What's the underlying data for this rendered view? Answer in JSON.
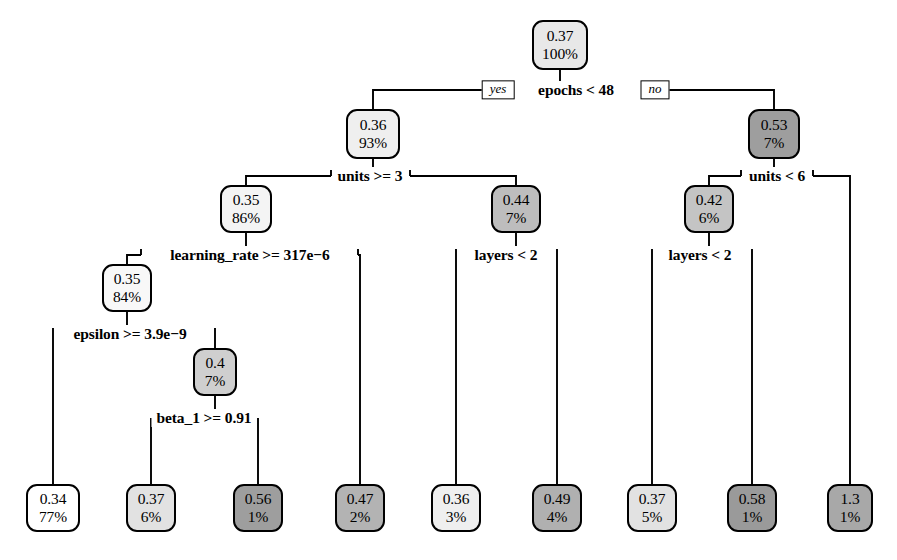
{
  "figure": {
    "kind": "decision-tree",
    "background": "#ffffff",
    "stroke": "#000000",
    "width": 897,
    "height": 560
  },
  "chart_data": {
    "type": "diagram",
    "subtype": "regression-decision-tree",
    "title": "",
    "xlabel": "",
    "ylabel": "",
    "branch_labels": {
      "yes": "yes",
      "no": "no"
    },
    "nodes": [
      {
        "id": "n0",
        "value": "0.37",
        "percent": "100%",
        "fill": "#e8e8e8",
        "x": 560,
        "y": 45,
        "w": 56,
        "h": 50
      },
      {
        "id": "n1",
        "value": "0.36",
        "percent": "93%",
        "fill": "#efefef",
        "x": 373,
        "y": 134,
        "w": 54,
        "h": 50
      },
      {
        "id": "n2",
        "value": "0.53",
        "percent": "7%",
        "fill": "#9e9e9e",
        "x": 774,
        "y": 134,
        "w": 52,
        "h": 50
      },
      {
        "id": "n3",
        "value": "0.35",
        "percent": "86%",
        "fill": "#f4f4f4",
        "x": 246,
        "y": 209,
        "w": 52,
        "h": 48
      },
      {
        "id": "n4",
        "value": "0.44",
        "percent": "7%",
        "fill": "#bdbdbd",
        "x": 516,
        "y": 209,
        "w": 50,
        "h": 48
      },
      {
        "id": "n5",
        "value": "0.42",
        "percent": "6%",
        "fill": "#c4c4c4",
        "x": 709,
        "y": 209,
        "w": 50,
        "h": 48
      },
      {
        "id": "n6",
        "value": "0.35",
        "percent": "84%",
        "fill": "#f8f8f8",
        "x": 127,
        "y": 288,
        "w": 50,
        "h": 48
      },
      {
        "id": "n7",
        "value": "0.4",
        "percent": "7%",
        "fill": "#cfcfcf",
        "x": 215,
        "y": 372,
        "w": 44,
        "h": 48
      },
      {
        "id": "n8",
        "value": "0.34",
        "percent": "77%",
        "fill": "#ffffff",
        "x": 53,
        "y": 508,
        "w": 54,
        "h": 48
      },
      {
        "id": "n9",
        "value": "0.37",
        "percent": "6%",
        "fill": "#e2e2e2",
        "x": 151,
        "y": 508,
        "w": 50,
        "h": 48
      },
      {
        "id": "n10",
        "value": "0.56",
        "percent": "1%",
        "fill": "#9e9e9e",
        "x": 258,
        "y": 508,
        "w": 50,
        "h": 48
      },
      {
        "id": "n11",
        "value": "0.47",
        "percent": "2%",
        "fill": "#b3b3b3",
        "x": 360,
        "y": 508,
        "w": 50,
        "h": 48
      },
      {
        "id": "n12",
        "value": "0.36",
        "percent": "3%",
        "fill": "#efefef",
        "x": 456,
        "y": 508,
        "w": 50,
        "h": 48
      },
      {
        "id": "n13",
        "value": "0.49",
        "percent": "4%",
        "fill": "#b0b0b0",
        "x": 557,
        "y": 508,
        "w": 50,
        "h": 48
      },
      {
        "id": "n14",
        "value": "0.37",
        "percent": "5%",
        "fill": "#e2e2e2",
        "x": 652,
        "y": 508,
        "w": 50,
        "h": 48
      },
      {
        "id": "n15",
        "value": "0.58",
        "percent": "1%",
        "fill": "#9a9a9a",
        "x": 752,
        "y": 508,
        "w": 50,
        "h": 48
      },
      {
        "id": "n16",
        "value": "1.3",
        "percent": "1%",
        "fill": "#a8a8a8",
        "x": 850,
        "y": 508,
        "w": 46,
        "h": 48
      }
    ],
    "splits": [
      {
        "id": "s0",
        "label": "epochs < 48",
        "x": 576,
        "y": 90,
        "parent": "n0",
        "yes_child": "n1",
        "no_child": "n2"
      },
      {
        "id": "s1",
        "label": "units >= 3",
        "x": 370,
        "y": 176,
        "parent": "n1",
        "yes_child": "n3",
        "no_child": "n4"
      },
      {
        "id": "s2",
        "label": "units < 6",
        "x": 777,
        "y": 176,
        "parent": "n2",
        "yes_child": "n5",
        "no_child": "n16"
      },
      {
        "id": "s3",
        "label": "learning_rate >= 317e−6",
        "x": 250,
        "y": 255,
        "parent": "n3",
        "yes_child": "n6",
        "no_child": "n11"
      },
      {
        "id": "s4",
        "label": "epsilon >= 3.9e−9",
        "x": 130,
        "y": 334,
        "parent": "n6",
        "yes_child": "n8",
        "no_child": "n7"
      },
      {
        "id": "s5",
        "label": "beta_1 >= 0.91",
        "x": 204,
        "y": 418,
        "parent": "n7",
        "yes_child": "n9",
        "no_child": "n10"
      },
      {
        "id": "s6",
        "label": "layers < 2",
        "x": 506,
        "y": 255,
        "parent": "n4",
        "yes_child": "n12",
        "no_child": "n13"
      },
      {
        "id": "s7",
        "label": "layers < 2",
        "x": 700,
        "y": 255,
        "parent": "n5",
        "yes_child": "n14",
        "no_child": "n15"
      }
    ],
    "edges": [
      {
        "from": "n0",
        "to": "s0",
        "path": "M 560,70 L 560,90"
      },
      {
        "from": "s0",
        "to": "n1",
        "path": "M 498,90 L 373,90 L 373,109"
      },
      {
        "from": "s0",
        "to": "n2",
        "path": "M 655,90 L 774,90 L 774,109"
      },
      {
        "from": "n1",
        "to": "s1",
        "path": "M 373,159 L 373,176"
      },
      {
        "from": "s1",
        "to": "n3",
        "path": "M 331,176 L 246,176 L 246,185"
      },
      {
        "from": "s1",
        "to": "n4",
        "path": "M 410,176 L 516,176 L 516,185"
      },
      {
        "from": "n2",
        "to": "s2",
        "path": "M 774,159 L 774,176"
      },
      {
        "from": "s2",
        "to": "n5",
        "path": "M 741,176 L 709,176 L 709,185"
      },
      {
        "from": "s2",
        "to": "n16",
        "path": "M 813,176 L 850,176 L 850,484"
      },
      {
        "from": "n3",
        "to": "s3",
        "path": "M 246,233 L 246,255"
      },
      {
        "from": "s3",
        "to": "n6",
        "path": "M 141,255 L 127,255 L 127,264"
      },
      {
        "from": "s3",
        "to": "n11",
        "path": "M 358,255 L 360,255 L 360,484"
      },
      {
        "from": "n6",
        "to": "s4",
        "path": "M 127,312 L 127,334"
      },
      {
        "from": "s4",
        "to": "n8",
        "path": "M 53,334 L 53,334 L 53,484"
      },
      {
        "from": "s4",
        "to": "n7",
        "path": "M 215,334 L 215,348"
      },
      {
        "from": "n7",
        "to": "s5",
        "path": "M 215,396 L 215,418"
      },
      {
        "from": "s5",
        "to": "n9",
        "path": "M 151,418 L 151,484"
      },
      {
        "from": "s5",
        "to": "n10",
        "path": "M 258,418 L 258,484"
      },
      {
        "from": "n4",
        "to": "s6",
        "path": "M 516,233 L 516,255"
      },
      {
        "from": "s6",
        "to": "n12",
        "path": "M 456,255 L 456,484"
      },
      {
        "from": "s6",
        "to": "n13",
        "path": "M 557,255 L 557,484"
      },
      {
        "from": "n5",
        "to": "s7",
        "path": "M 709,233 L 709,255"
      },
      {
        "from": "s7",
        "to": "n14",
        "path": "M 652,255 L 652,484"
      },
      {
        "from": "s7",
        "to": "n15",
        "path": "M 752,255 L 752,484"
      }
    ],
    "yesno_boxes": [
      {
        "id": "yes0",
        "label": "yes",
        "x": 498,
        "y": 90
      },
      {
        "id": "no0",
        "label": "no",
        "x": 655,
        "y": 90
      }
    ],
    "connector_stubs": [
      {
        "path": "M 331,176 L 331,170"
      },
      {
        "path": "M 410,176 L 410,170"
      },
      {
        "path": "M 741,176 L 741,170"
      },
      {
        "path": "M 813,176 L 813,170"
      },
      {
        "path": "M 141,255 L 141,249"
      },
      {
        "path": "M 358,255 L 358,249"
      },
      {
        "path": "M 53,334 L 53,328"
      },
      {
        "path": "M 215,334 L 215,328"
      },
      {
        "path": "M 456,255 L 456,249"
      },
      {
        "path": "M 557,255 L 557,249"
      },
      {
        "path": "M 652,255 L 652,249"
      },
      {
        "path": "M 752,255 L 752,249"
      }
    ]
  }
}
